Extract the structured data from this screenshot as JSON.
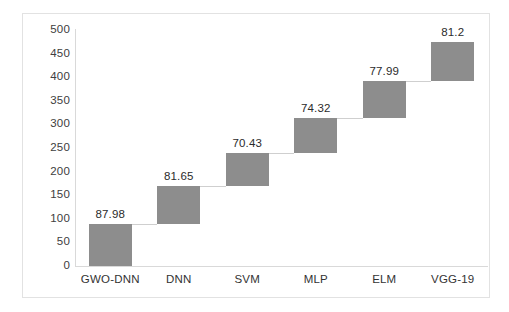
{
  "chart_data": {
    "type": "bar",
    "title": "",
    "subtitle": "",
    "xlabel": "",
    "ylabel": "",
    "categories": [
      "GWO-DNN",
      "DNN",
      "SVM",
      "MLP",
      "ELM",
      "VGG-19"
    ],
    "values": [
      87.98,
      81.65,
      70.43,
      74.32,
      77.99,
      81.2
    ],
    "data_labels": [
      "87.98",
      "81.65",
      "70.43",
      "74.32",
      "77.99",
      "81.2"
    ],
    "bar_bases": [
      0,
      87.98,
      169.63,
      240.06,
      314.38,
      392.37
    ],
    "bar_tops": [
      87.98,
      169.63,
      240.06,
      314.38,
      392.37,
      473.57
    ],
    "stacking": "waterfall-cumulative",
    "ylim": [
      0,
      500
    ],
    "ytick_labels": [
      "0",
      "50",
      "100",
      "150",
      "200",
      "250",
      "300",
      "350",
      "400",
      "450",
      "500"
    ],
    "ytick_values": [
      0,
      50,
      100,
      150,
      200,
      250,
      300,
      350,
      400,
      450,
      500
    ],
    "grid": false,
    "legend": "none",
    "bar_color": "#8d8d8d",
    "axis_color": "#d9d9d9",
    "connector_color": "#cfcfcf",
    "frame_color": "#e2e2e2",
    "background": "#ffffff",
    "label_color": "#2b2b2b"
  }
}
